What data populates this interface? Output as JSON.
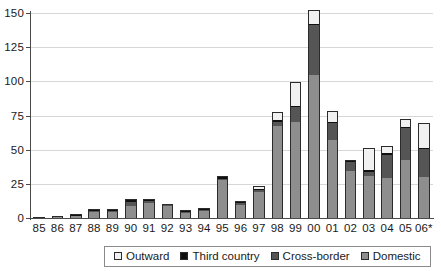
{
  "chart_data": {
    "type": "bar",
    "stacked": true,
    "title": "",
    "subtitle": "",
    "xlabel": "",
    "ylabel": "",
    "ylim": [
      0,
      150
    ],
    "yticks": [
      0,
      25,
      50,
      75,
      100,
      125,
      150
    ],
    "ytick_labels": [
      "0",
      "25",
      "50",
      "75",
      "100",
      "125",
      "150"
    ],
    "grid": "horizontal",
    "legend_position": "bottom",
    "categories": [
      "85",
      "86",
      "87",
      "88",
      "89",
      "90",
      "91",
      "92",
      "93",
      "94",
      "95",
      "96",
      "97",
      "98",
      "99",
      "00",
      "01",
      "02",
      "03",
      "04",
      "05",
      "06*"
    ],
    "series": [
      {
        "name": "Domestic",
        "color": "#8e8e8e",
        "values": [
          0.5,
          1.2,
          2.2,
          5.0,
          5.2,
          9.0,
          11.0,
          9.0,
          4.0,
          6.0,
          28.0,
          10.0,
          19.0,
          67.0,
          70.5,
          105.0,
          57.0,
          35.0,
          30.5,
          29.0,
          42.5,
          30.5
        ]
      },
      {
        "name": "Cross-border",
        "color": "#555555",
        "values": [
          0,
          0.2,
          0.3,
          1.0,
          0.6,
          3.0,
          2.0,
          0.8,
          0.7,
          0.6,
          1.0,
          1.3,
          2.0,
          3.5,
          11.0,
          36.0,
          12.5,
          6.5,
          3.0,
          17.0,
          23.5,
          20.5
        ]
      },
      {
        "name": "Third country",
        "color": "#101010",
        "values": [
          0,
          0,
          0.2,
          0.4,
          0.3,
          1.5,
          0.5,
          0.4,
          0.3,
          0.3,
          1.5,
          0.5,
          0.4,
          1.5,
          0.5,
          1.0,
          0.5,
          0.8,
          1.5,
          1.5,
          0.6,
          0.4
        ]
      },
      {
        "name": "Outward",
        "color": "#f1f1f1",
        "values": [
          0,
          0.1,
          0.3,
          0.4,
          0.4,
          0.5,
          0.5,
          0.4,
          0.5,
          0.5,
          0.5,
          0.7,
          2.2,
          5.5,
          17.5,
          10.0,
          8.5,
          0.2,
          16.5,
          5.5,
          5.5,
          18.0
        ]
      }
    ],
    "totals": [
      0.5,
      1.5,
      3.0,
      6.8,
      6.5,
      14.0,
      14.0,
      10.6,
      5.5,
      7.4,
      31.0,
      12.5,
      23.6,
      77.5,
      99.5,
      152.0,
      78.5,
      42.5,
      51.5,
      53.0,
      72.1,
      69.4
    ],
    "legend": [
      {
        "label": "Outward",
        "swatch": "#f1f1f1"
      },
      {
        "label": "Third country",
        "swatch": "#101010"
      },
      {
        "label": "Cross-border",
        "swatch": "#555555"
      },
      {
        "label": "Domestic",
        "swatch": "#8e8e8e"
      }
    ],
    "axis_color": "#4a4a4a",
    "grid_color": "#d7d7d7"
  }
}
